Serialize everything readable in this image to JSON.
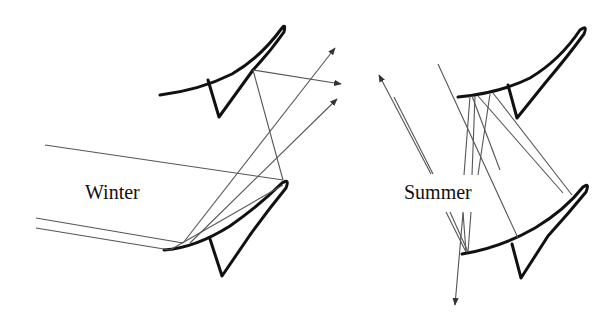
{
  "diagram": {
    "panels": [
      {
        "id": "winter",
        "label": "Winter",
        "shelves": 2,
        "description": "Low-angle sun rays reflected upward by the lower light shelf and onto the upper shelf"
      },
      {
        "id": "summer",
        "label": "Summer",
        "shelves": 2,
        "description": "High-angle sun rays bouncing between shelves and redirected downward/outward"
      }
    ],
    "colors": {
      "shelf_stroke": "#111111",
      "ray_stroke": "#555555",
      "background": "#ffffff"
    }
  }
}
